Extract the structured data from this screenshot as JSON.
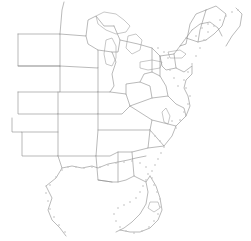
{
  "figure": {
    "width": 251,
    "height": 241,
    "background_color": "#ffffff",
    "boundary_color": "#8c8c8c",
    "marker_color": "#c2c2c2",
    "has_labels": false,
    "has_legend": false,
    "has_frame": false,
    "projection_note": "plain outline, no text annotations visible"
  },
  "chart_data": {
    "type": "map",
    "title": "",
    "xlabel": "",
    "ylabel": "",
    "grid": false,
    "legend": "none",
    "region": "Eastern and Central United States",
    "features": [
      "state-boundaries",
      "atlantic-coastline",
      "gulf-coastline",
      "great-lakes",
      "coastal-point-markers"
    ],
    "states_depicted": [
      "North Dakota",
      "South Dakota",
      "Nebraska",
      "Kansas",
      "Oklahoma",
      "Texas",
      "Minnesota",
      "Iowa",
      "Missouri",
      "Arkansas",
      "Louisiana",
      "Wisconsin",
      "Illinois",
      "Michigan",
      "Indiana",
      "Ohio",
      "Kentucky",
      "Tennessee",
      "Mississippi",
      "Alabama",
      "Georgia",
      "Florida",
      "South Carolina",
      "North Carolina",
      "Virginia",
      "West Virginia",
      "Maryland",
      "Delaware",
      "Pennsylvania",
      "New Jersey",
      "New York",
      "Connecticut",
      "Rhode Island",
      "Massachusetts",
      "Vermont",
      "New Hampshire",
      "Maine"
    ],
    "water_bodies": [
      "Lake Superior",
      "Lake Michigan",
      "Lake Huron",
      "Lake Erie",
      "Lake Ontario",
      "Chesapeake Bay",
      "Lake Okeechobee",
      "Gulf of Mexico",
      "Atlantic Ocean"
    ],
    "coastal_marker_count": 78,
    "marker_shape": "small-square-dot"
  },
  "geometry": {
    "state_outlines": [
      "M 18 34 L 18 66 L 60 66 L 60 92 L 18 92",
      "M 18 66 L 60 66",
      "M 18 34 L 60 34 L 60 66",
      "M 60 34 L 62 10 L 64 2",
      "M 18 92 L 18 114 L 58 114 L 58 92",
      "M 12 118 L 12 132 L 22 132 L 22 156 L 58 156 L 58 132 L 58 114",
      "M 22 132 L 58 132",
      "M 58 156 L 62 168 L 56 178 L 46 186",
      "M 60 34 L 86 36 L 88 20 L 96 16 L 104 26 L 114 26",
      "M 60 66 L 98 68 L 98 50 L 88 44 L 86 36",
      "M 60 92 L 98 92 L 98 68",
      "M 58 114 L 98 114 L 98 92",
      "M 58 156 L 96 156 L 98 130 L 98 114",
      "M 98 50 L 112 52 L 116 62 L 112 74 L 114 86 L 110 92 L 98 92",
      "M 114 26 L 120 40 L 118 52 L 112 52",
      "M 110 92 L 126 94 L 130 106 L 122 114 L 98 114",
      "M 98 130 L 150 130 L 152 120 L 130 106",
      "M 96 156 L 110 156 L 118 152 L 132 152 L 148 148 L 150 130",
      "M 96 156 L 98 180 L 112 182",
      "M 118 152 L 118 182",
      "M 132 152 L 134 176 L 146 182 L 150 176",
      "M 148 148 L 164 146 L 172 136 L 176 126 L 152 120",
      "M 150 130 L 164 146",
      "M 176 126 L 186 116 L 184 108 L 176 104 L 168 96 L 152 98 L 130 106",
      "M 152 98 L 150 86 L 140 82 L 126 84 L 126 94",
      "M 140 82 L 144 74 L 152 72 L 160 76 L 166 86 L 168 96",
      "M 120 40 L 138 44 L 152 48 L 160 56 L 160 76",
      "M 152 48 L 152 72",
      "M 160 56 L 174 54 L 180 46 L 186 38 L 192 30",
      "M 174 54 L 176 68 L 184 72 L 192 66",
      "M 176 68 L 166 70 L 162 66 L 160 56",
      "M 180 46 L 186 44 L 188 34 L 190 24 L 196 14 L 206 10",
      "M 186 38 L 198 42 L 206 40",
      "M 198 42 L 200 30 L 206 10",
      "M 206 10 L 216 6 L 226 14 L 222 26 L 214 34 L 206 40"
    ],
    "coastlines": [
      "M 46 186 L 52 198 L 48 210 L 52 220 L 60 228 L 66 236",
      "M 62 168 L 72 166 L 82 168 L 92 166 L 98 168 L 108 164 L 118 162 L 128 160 L 136 158 L 146 156",
      "M 98 180 L 112 182 L 118 182 L 126 180 L 134 176",
      "M 146 182 L 148 192 L 146 204 L 140 214 L 132 222 L 124 228 L 116 232",
      "M 150 176 L 156 186 L 160 198 L 162 210 L 158 220 L 150 228 L 140 232 L 130 232 L 120 230",
      "M 186 116 L 190 106 L 188 96 L 184 88 L 186 80 L 192 74 L 192 66",
      "M 192 30 L 200 24 L 210 22 L 218 28 L 222 36",
      "M 236 8 L 242 14 L 240 26 L 232 36 L 226 46"
    ],
    "lakes": [
      "M 96 16 L 104 12 L 116 14 L 124 20 L 130 26 L 126 32 L 116 34 L 106 30 L 98 24 Z",
      "M 106 40 L 112 38 L 116 46 L 116 58 L 112 66 L 106 64 L 104 54 Z",
      "M 128 36 L 136 34 L 142 40 L 140 50 L 132 54 L 126 48 Z",
      "M 140 62 L 152 60 L 162 62 L 160 68 L 148 70 L 140 68 Z",
      "M 168 52 L 180 50 L 186 54 L 182 58 L 170 58 Z",
      "M 166 108 L 170 116 L 168 124 L 164 122 L 162 112 Z",
      "M 150 202 L 158 202 L 160 208 L 154 212 L 148 208 Z"
    ],
    "coast_markers": [
      [
        150,
        131
      ],
      [
        155,
        136
      ],
      [
        160,
        141
      ],
      [
        164,
        147
      ],
      [
        161,
        153
      ],
      [
        158,
        159
      ],
      [
        155,
        165
      ],
      [
        152,
        171
      ],
      [
        152,
        178
      ],
      [
        154,
        185
      ],
      [
        157,
        192
      ],
      [
        160,
        199
      ],
      [
        161,
        207
      ],
      [
        158,
        214
      ],
      [
        154,
        221
      ],
      [
        149,
        227
      ],
      [
        142,
        231
      ],
      [
        134,
        233
      ],
      [
        126,
        231
      ],
      [
        120,
        227
      ],
      [
        116,
        221
      ],
      [
        114,
        214
      ],
      [
        118,
        208
      ],
      [
        124,
        205
      ],
      [
        130,
        202
      ],
      [
        136,
        198
      ],
      [
        140,
        192
      ],
      [
        143,
        186
      ],
      [
        146,
        180
      ],
      [
        148,
        174
      ],
      [
        146,
        167
      ],
      [
        140,
        163
      ],
      [
        132,
        161
      ],
      [
        124,
        162
      ],
      [
        116,
        163
      ],
      [
        108,
        165
      ],
      [
        100,
        167
      ],
      [
        92,
        167
      ],
      [
        84,
        168
      ],
      [
        76,
        167
      ],
      [
        68,
        167
      ],
      [
        62,
        170
      ],
      [
        56,
        177
      ],
      [
        50,
        185
      ],
      [
        46,
        193
      ],
      [
        48,
        201
      ],
      [
        50,
        209
      ],
      [
        54,
        217
      ],
      [
        59,
        225
      ],
      [
        65,
        232
      ],
      [
        172,
        121
      ],
      [
        176,
        128
      ],
      [
        180,
        120
      ],
      [
        184,
        112
      ],
      [
        188,
        104
      ],
      [
        190,
        96
      ],
      [
        186,
        88
      ],
      [
        184,
        80
      ],
      [
        188,
        72
      ],
      [
        192,
        64
      ],
      [
        196,
        56
      ],
      [
        200,
        48
      ],
      [
        204,
        40
      ],
      [
        208,
        32
      ],
      [
        214,
        26
      ],
      [
        220,
        20
      ],
      [
        226,
        16
      ],
      [
        232,
        12
      ],
      [
        238,
        10
      ],
      [
        170,
        70
      ],
      [
        174,
        78
      ],
      [
        178,
        86
      ],
      [
        168,
        58
      ],
      [
        164,
        52
      ],
      [
        158,
        48
      ],
      [
        196,
        36
      ],
      [
        202,
        28
      ],
      [
        208,
        24
      ]
    ]
  }
}
